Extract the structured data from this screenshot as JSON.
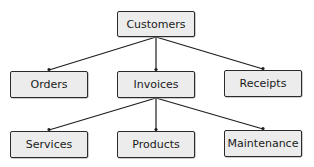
{
  "diagram": {
    "type": "hierarchy",
    "nodes": [
      {
        "id": "customers",
        "label": "Customers",
        "x": 117,
        "y": 11,
        "w": 78,
        "h": 26
      },
      {
        "id": "orders",
        "label": "Orders",
        "x": 10,
        "y": 71,
        "w": 78,
        "h": 27
      },
      {
        "id": "invoices",
        "label": "Invoices",
        "x": 117,
        "y": 71,
        "w": 78,
        "h": 27
      },
      {
        "id": "receipts",
        "label": "Receipts",
        "x": 224,
        "y": 70,
        "w": 78,
        "h": 27
      },
      {
        "id": "services",
        "label": "Services",
        "x": 10,
        "y": 131,
        "w": 78,
        "h": 27
      },
      {
        "id": "products",
        "label": "Products",
        "x": 117,
        "y": 131,
        "w": 78,
        "h": 27
      },
      {
        "id": "maintenance",
        "label": "Maintenance",
        "x": 224,
        "y": 130,
        "w": 78,
        "h": 27
      }
    ],
    "edges": [
      {
        "from": "customers",
        "to": "orders"
      },
      {
        "from": "customers",
        "to": "invoices"
      },
      {
        "from": "customers",
        "to": "receipts"
      },
      {
        "from": "invoices",
        "to": "services"
      },
      {
        "from": "invoices",
        "to": "products"
      },
      {
        "from": "invoices",
        "to": "maintenance"
      }
    ],
    "colors": {
      "box_fill": "#ececec",
      "box_border": "#2b2b2b",
      "line": "#1e1e1e"
    }
  }
}
